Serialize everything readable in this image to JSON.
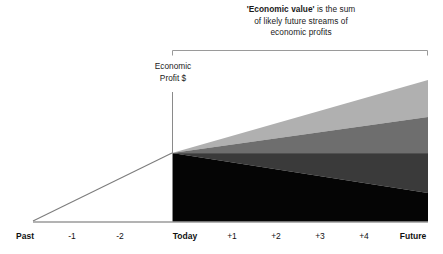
{
  "callout": {
    "line1_bold": "'Economic value'",
    "line1_rest": " is the sum",
    "line2": "of likely future streams of",
    "line3": "economic profits"
  },
  "axis": {
    "y_label_line1": "Economic",
    "y_label_line2": "Profit $"
  },
  "chart_data": {
    "type": "area",
    "title": "'Economic value' is the sum of likely future streams of economic profits",
    "xlabel": "",
    "ylabel": "Economic Profit $",
    "categories": [
      "Past",
      "-1",
      "-2",
      "Today",
      "+1",
      "+2",
      "+3",
      "+4",
      "Future"
    ],
    "tick_x_px": [
      25,
      72,
      120,
      185,
      232,
      276,
      320,
      364,
      413
    ],
    "tick_bold": [
      true,
      false,
      false,
      true,
      false,
      false,
      false,
      false,
      true
    ],
    "grid": false,
    "legend": "none",
    "origin_px": {
      "x": 172,
      "y": 153
    },
    "baseline_y_px": 222,
    "right_edge_x_px": 428,
    "past_line": {
      "x0": 33,
      "y0": 221,
      "x1": 172,
      "y1": 153
    },
    "bands": [
      {
        "name": "light-gray-band",
        "color": "#b0b0b0",
        "top_right_y_px": 80,
        "bottom_right_y_px": 117
      },
      {
        "name": "medium-gray-band",
        "color": "#6e6e6e",
        "top_right_y_px": 117,
        "bottom_right_y_px": 153
      },
      {
        "name": "dark-gray-band",
        "color": "#3a3a3a",
        "top_right_y_px": 153,
        "bottom_right_y_px": 193
      },
      {
        "name": "black-band",
        "color": "#050505",
        "top_right_y_px": 193,
        "bottom_right_y_px": 222
      }
    ],
    "bracket": {
      "x_start": 172,
      "x_end": 428,
      "y": 50,
      "tick_height": 5
    }
  },
  "colors": {
    "light_gray": "#b0b0b0",
    "medium_gray": "#6e6e6e",
    "dark_gray": "#3a3a3a",
    "black": "#050505",
    "line": "#808080",
    "text": "#111111"
  }
}
